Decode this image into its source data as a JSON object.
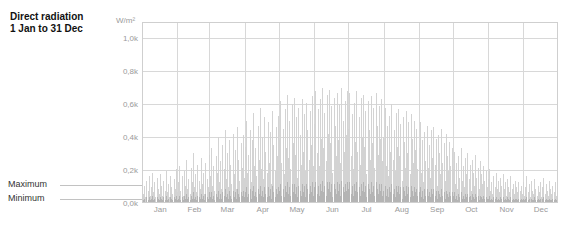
{
  "title": {
    "line1": "Direct radiation",
    "line2": "1 Jan to 31 Dec"
  },
  "annotations": [
    {
      "label": "Maximum",
      "value_k": 0.13
    },
    {
      "label": "Minimum",
      "value_k": 0.04
    }
  ],
  "colors": {
    "bar_max": "#d3d3d3",
    "bar_min": "#b4b4b4",
    "grid": "#d8d8d8",
    "border": "#cfcfcf",
    "axis_text": "#9a9a9a",
    "title_text": "#111111",
    "annotation_text": "#333333",
    "leader": "#c2c2c2",
    "background": "#ffffff"
  },
  "chart_data": {
    "type": "bar",
    "title": "Direct radiation",
    "subtitle": "1 Jan to 31 Dec",
    "xlabel": "",
    "ylabel": "W/m²",
    "yunit": "W/m²",
    "ylim": [
      0,
      1.1
    ],
    "grid": true,
    "legend": "none",
    "y_ticks": [
      {
        "value": 1.0,
        "label": "1,0k"
      },
      {
        "value": 0.8,
        "label": "0,8k"
      },
      {
        "value": 0.6,
        "label": "0,6k"
      },
      {
        "value": 0.4,
        "label": "0,4k"
      },
      {
        "value": 0.2,
        "label": "0,2k"
      },
      {
        "value": 0.0,
        "label": "0,0k"
      }
    ],
    "x_ticks": [
      {
        "label": "Jan",
        "day": 16
      },
      {
        "label": "Feb",
        "day": 46
      },
      {
        "label": "Mar",
        "day": 75
      },
      {
        "label": "Apr",
        "day": 106
      },
      {
        "label": "May",
        "day": 136
      },
      {
        "label": "Jun",
        "day": 167
      },
      {
        "label": "Jul",
        "day": 197
      },
      {
        "label": "Aug",
        "day": 228
      },
      {
        "label": "Sep",
        "day": 259
      },
      {
        "label": "Oct",
        "day": 289
      },
      {
        "label": "Nov",
        "day": 320
      },
      {
        "label": "Dec",
        "day": 350
      }
    ],
    "month_boundaries": [
      0,
      31,
      59,
      90,
      120,
      151,
      181,
      212,
      243,
      273,
      304,
      334,
      365
    ],
    "categories": [
      "Jan",
      "Feb",
      "Mar",
      "Apr",
      "May",
      "Jun",
      "Jul",
      "Aug",
      "Sep",
      "Oct",
      "Nov",
      "Dec"
    ],
    "monthly_mean_max_k": [
      0.1,
      0.16,
      0.27,
      0.36,
      0.43,
      0.46,
      0.44,
      0.36,
      0.27,
      0.17,
      0.09,
      0.07
    ],
    "monthly_peak_max_k": [
      0.2,
      0.3,
      0.46,
      0.58,
      0.66,
      0.7,
      0.68,
      0.6,
      0.49,
      0.33,
      0.2,
      0.16
    ],
    "series": [
      {
        "name": "Maximum",
        "unit": "W/m²",
        "values_k": [
          0.05,
          0.1,
          0.03,
          0.13,
          0.07,
          0.16,
          0.04,
          0.09,
          0.18,
          0.06,
          0.12,
          0.03,
          0.15,
          0.08,
          0.05,
          0.17,
          0.1,
          0.04,
          0.13,
          0.07,
          0.19,
          0.06,
          0.11,
          0.03,
          0.16,
          0.09,
          0.05,
          0.14,
          0.08,
          0.2,
          0.06,
          0.12,
          0.22,
          0.07,
          0.16,
          0.04,
          0.19,
          0.1,
          0.26,
          0.08,
          0.14,
          0.05,
          0.21,
          0.12,
          0.3,
          0.09,
          0.17,
          0.06,
          0.23,
          0.13,
          0.08,
          0.27,
          0.11,
          0.18,
          0.05,
          0.24,
          0.14,
          0.09,
          0.29,
          0.16,
          0.33,
          0.1,
          0.22,
          0.07,
          0.28,
          0.18,
          0.4,
          0.12,
          0.25,
          0.08,
          0.35,
          0.2,
          0.44,
          0.14,
          0.3,
          0.09,
          0.38,
          0.23,
          0.11,
          0.42,
          0.17,
          0.32,
          0.08,
          0.46,
          0.26,
          0.13,
          0.36,
          0.21,
          0.41,
          0.15,
          0.34,
          0.5,
          0.18,
          0.29,
          0.44,
          0.12,
          0.38,
          0.55,
          0.22,
          0.33,
          0.16,
          0.47,
          0.26,
          0.58,
          0.2,
          0.4,
          0.14,
          0.52,
          0.31,
          0.18,
          0.49,
          0.24,
          0.43,
          0.11,
          0.56,
          0.35,
          0.19,
          0.46,
          0.28,
          0.53,
          0.38,
          0.62,
          0.24,
          0.45,
          0.17,
          0.57,
          0.33,
          0.66,
          0.27,
          0.5,
          0.2,
          0.6,
          0.36,
          0.64,
          0.29,
          0.52,
          0.15,
          0.58,
          0.41,
          0.23,
          0.63,
          0.31,
          0.54,
          0.19,
          0.61,
          0.44,
          0.26,
          0.56,
          0.35,
          0.65,
          0.22,
          0.48,
          0.68,
          0.3,
          0.57,
          0.22,
          0.63,
          0.39,
          0.7,
          0.33,
          0.55,
          0.25,
          0.66,
          0.42,
          0.69,
          0.36,
          0.59,
          0.18,
          0.64,
          0.47,
          0.28,
          0.67,
          0.38,
          0.6,
          0.24,
          0.7,
          0.5,
          0.31,
          0.62,
          0.41,
          0.68,
          0.45,
          0.67,
          0.28,
          0.54,
          0.2,
          0.61,
          0.37,
          0.68,
          0.31,
          0.52,
          0.23,
          0.64,
          0.4,
          0.66,
          0.34,
          0.56,
          0.17,
          0.62,
          0.44,
          0.26,
          0.65,
          0.36,
          0.58,
          0.21,
          0.67,
          0.47,
          0.29,
          0.59,
          0.39,
          0.63,
          0.25,
          0.4,
          0.58,
          0.22,
          0.47,
          0.16,
          0.53,
          0.31,
          0.6,
          0.26,
          0.44,
          0.19,
          0.55,
          0.34,
          0.57,
          0.28,
          0.48,
          0.13,
          0.52,
          0.37,
          0.21,
          0.56,
          0.3,
          0.49,
          0.17,
          0.54,
          0.39,
          0.24,
          0.5,
          0.32,
          0.45,
          0.2,
          0.33,
          0.49,
          0.18,
          0.38,
          0.12,
          0.43,
          0.25,
          0.47,
          0.21,
          0.35,
          0.15,
          0.44,
          0.27,
          0.46,
          0.23,
          0.39,
          0.1,
          0.41,
          0.3,
          0.17,
          0.45,
          0.24,
          0.36,
          0.13,
          0.42,
          0.28,
          0.19,
          0.37,
          0.22,
          0.33,
          0.2,
          0.31,
          0.11,
          0.24,
          0.08,
          0.28,
          0.15,
          0.33,
          0.13,
          0.22,
          0.09,
          0.27,
          0.17,
          0.3,
          0.14,
          0.23,
          0.07,
          0.26,
          0.18,
          0.1,
          0.29,
          0.15,
          0.21,
          0.08,
          0.25,
          0.17,
          0.11,
          0.22,
          0.13,
          0.19,
          0.09,
          0.14,
          0.2,
          0.07,
          0.12,
          0.05,
          0.16,
          0.09,
          0.18,
          0.08,
          0.13,
          0.06,
          0.15,
          0.1,
          0.17,
          0.08,
          0.12,
          0.04,
          0.14,
          0.09,
          0.06,
          0.16,
          0.08,
          0.11,
          0.05,
          0.13,
          0.09,
          0.06,
          0.12,
          0.07,
          0.1,
          0.05,
          0.12,
          0.04,
          0.09,
          0.16,
          0.06,
          0.11,
          0.03,
          0.13,
          0.07,
          0.05,
          0.14,
          0.08,
          0.04,
          0.1,
          0.06,
          0.12,
          0.03,
          0.09,
          0.15,
          0.05,
          0.11,
          0.07,
          0.04,
          0.13,
          0.08,
          0.05,
          0.1,
          0.06,
          0.12,
          0.04
        ]
      },
      {
        "name": "Minimum",
        "unit": "W/m²",
        "values_k": [
          0.01,
          0.02,
          0.0,
          0.03,
          0.01,
          0.03,
          0.01,
          0.02,
          0.04,
          0.01,
          0.02,
          0.0,
          0.03,
          0.02,
          0.01,
          0.03,
          0.02,
          0.01,
          0.03,
          0.01,
          0.04,
          0.01,
          0.02,
          0.0,
          0.03,
          0.02,
          0.01,
          0.03,
          0.02,
          0.04,
          0.01,
          0.02,
          0.04,
          0.01,
          0.03,
          0.01,
          0.04,
          0.02,
          0.05,
          0.02,
          0.03,
          0.01,
          0.04,
          0.02,
          0.06,
          0.02,
          0.03,
          0.01,
          0.04,
          0.03,
          0.02,
          0.05,
          0.02,
          0.04,
          0.01,
          0.05,
          0.03,
          0.02,
          0.06,
          0.03,
          0.06,
          0.02,
          0.04,
          0.01,
          0.05,
          0.03,
          0.07,
          0.02,
          0.05,
          0.02,
          0.06,
          0.04,
          0.08,
          0.03,
          0.05,
          0.02,
          0.07,
          0.04,
          0.02,
          0.07,
          0.03,
          0.06,
          0.02,
          0.08,
          0.05,
          0.03,
          0.06,
          0.04,
          0.07,
          0.03,
          0.06,
          0.09,
          0.03,
          0.05,
          0.08,
          0.02,
          0.07,
          0.1,
          0.04,
          0.06,
          0.03,
          0.08,
          0.05,
          0.1,
          0.04,
          0.07,
          0.03,
          0.09,
          0.05,
          0.03,
          0.09,
          0.04,
          0.08,
          0.02,
          0.1,
          0.06,
          0.03,
          0.08,
          0.05,
          0.09,
          0.07,
          0.11,
          0.04,
          0.08,
          0.03,
          0.1,
          0.06,
          0.12,
          0.05,
          0.09,
          0.04,
          0.11,
          0.06,
          0.11,
          0.05,
          0.09,
          0.03,
          0.1,
          0.07,
          0.04,
          0.11,
          0.06,
          0.1,
          0.03,
          0.11,
          0.08,
          0.05,
          0.1,
          0.06,
          0.12,
          0.04,
          0.09,
          0.12,
          0.05,
          0.1,
          0.04,
          0.11,
          0.07,
          0.13,
          0.06,
          0.1,
          0.04,
          0.12,
          0.08,
          0.12,
          0.06,
          0.11,
          0.03,
          0.11,
          0.08,
          0.05,
          0.12,
          0.07,
          0.11,
          0.04,
          0.13,
          0.09,
          0.06,
          0.11,
          0.07,
          0.12,
          0.08,
          0.12,
          0.05,
          0.1,
          0.04,
          0.11,
          0.07,
          0.12,
          0.06,
          0.09,
          0.04,
          0.11,
          0.07,
          0.12,
          0.06,
          0.1,
          0.03,
          0.11,
          0.08,
          0.05,
          0.12,
          0.06,
          0.1,
          0.04,
          0.12,
          0.08,
          0.05,
          0.11,
          0.07,
          0.11,
          0.04,
          0.07,
          0.1,
          0.04,
          0.08,
          0.03,
          0.09,
          0.06,
          0.11,
          0.05,
          0.08,
          0.03,
          0.1,
          0.06,
          0.1,
          0.05,
          0.09,
          0.02,
          0.09,
          0.07,
          0.04,
          0.1,
          0.05,
          0.09,
          0.03,
          0.1,
          0.07,
          0.04,
          0.09,
          0.06,
          0.08,
          0.04,
          0.06,
          0.09,
          0.03,
          0.07,
          0.02,
          0.08,
          0.04,
          0.08,
          0.04,
          0.06,
          0.03,
          0.08,
          0.05,
          0.08,
          0.04,
          0.07,
          0.02,
          0.07,
          0.05,
          0.03,
          0.08,
          0.04,
          0.06,
          0.02,
          0.07,
          0.05,
          0.03,
          0.06,
          0.04,
          0.06,
          0.04,
          0.06,
          0.02,
          0.04,
          0.01,
          0.05,
          0.03,
          0.06,
          0.02,
          0.04,
          0.02,
          0.05,
          0.03,
          0.05,
          0.03,
          0.04,
          0.01,
          0.05,
          0.03,
          0.02,
          0.05,
          0.03,
          0.04,
          0.01,
          0.04,
          0.03,
          0.02,
          0.04,
          0.02,
          0.03,
          0.02,
          0.02,
          0.04,
          0.01,
          0.02,
          0.01,
          0.03,
          0.02,
          0.03,
          0.01,
          0.02,
          0.01,
          0.03,
          0.02,
          0.03,
          0.01,
          0.02,
          0.01,
          0.03,
          0.02,
          0.01,
          0.03,
          0.01,
          0.02,
          0.01,
          0.02,
          0.02,
          0.01,
          0.02,
          0.01,
          0.02,
          0.01,
          0.02,
          0.01,
          0.02,
          0.03,
          0.01,
          0.02,
          0.0,
          0.02,
          0.01,
          0.01,
          0.03,
          0.01,
          0.01,
          0.02,
          0.01,
          0.02,
          0.0,
          0.02,
          0.03,
          0.01,
          0.02,
          0.01,
          0.01,
          0.02,
          0.01,
          0.01,
          0.02,
          0.01,
          0.02,
          0.01
        ]
      }
    ]
  }
}
